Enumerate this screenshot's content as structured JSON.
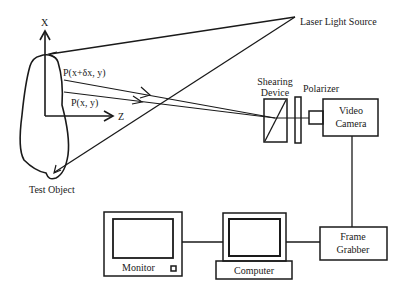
{
  "diagram": {
    "type": "shearography setup schematic",
    "labels": {
      "axis_x": "X",
      "axis_z": "Z",
      "point_p_shifted": "P(x+δx, y)",
      "point_p": "P(x, y)",
      "test_object": "Test Object",
      "laser": "Laser Light Source",
      "shearing_line1": "Shearing",
      "shearing_line2": "Device",
      "polarizer": "Polarizer",
      "camera_line1": "Video",
      "camera_line2": "Camera",
      "grabber_line1": "Frame",
      "grabber_line2": "Grabber",
      "computer": "Computer",
      "monitor": "Monitor"
    },
    "components": [
      {
        "name": "Test Object"
      },
      {
        "name": "Laser Light Source"
      },
      {
        "name": "Shearing Device"
      },
      {
        "name": "Polarizer"
      },
      {
        "name": "Video Camera"
      },
      {
        "name": "Frame Grabber"
      },
      {
        "name": "Computer"
      },
      {
        "name": "Monitor"
      }
    ],
    "connections": [
      [
        "Laser Light Source",
        "Test Object"
      ],
      [
        "Test Object",
        "Shearing Device"
      ],
      [
        "Shearing Device",
        "Polarizer"
      ],
      [
        "Polarizer",
        "Video Camera"
      ],
      [
        "Video Camera",
        "Frame Grabber"
      ],
      [
        "Frame Grabber",
        "Computer"
      ],
      [
        "Computer",
        "Monitor"
      ]
    ]
  }
}
